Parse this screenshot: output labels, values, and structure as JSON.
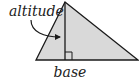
{
  "diagram": {
    "type": "triangle-altitude",
    "labels": {
      "altitude": "altitude",
      "base": "base"
    },
    "colors": {
      "fill": "#d9d9d9",
      "stroke": "#1a1a1a",
      "text": "#222222"
    },
    "triangle": {
      "apex": [
        65,
        2
      ],
      "base_left": [
        36,
        60
      ],
      "base_right": [
        138,
        60
      ]
    }
  }
}
